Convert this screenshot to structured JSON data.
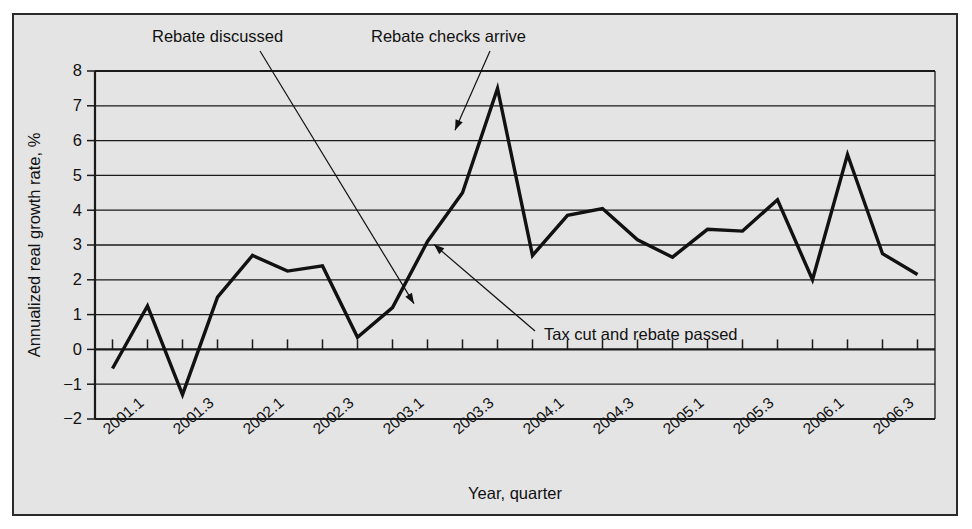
{
  "figure": {
    "top_cut_text": "",
    "background_color": "#e4e4e4",
    "frame_color": "#2a2a2a",
    "line_color": "#111111"
  },
  "chart_data": {
    "type": "line",
    "title": "",
    "xlabel": "Year, quarter",
    "ylabel": "Annualized real growth rate, %",
    "ylim": [
      -2,
      8
    ],
    "ytick_step": 1,
    "grid": true,
    "legend": "none",
    "x": [
      "2001.1",
      "2001.2",
      "2001.3",
      "2001.4",
      "2002.1",
      "2002.2",
      "2002.3",
      "2002.4",
      "2003.1",
      "2003.2",
      "2003.3",
      "2003.4",
      "2004.1",
      "2004.2",
      "2004.3",
      "2004.4",
      "2005.1",
      "2005.2",
      "2005.3",
      "2005.4",
      "2006.1",
      "2006.2",
      "2006.3",
      "2006.4"
    ],
    "values": [
      -0.55,
      1.25,
      -1.3,
      1.5,
      2.7,
      2.25,
      2.4,
      0.35,
      1.2,
      3.1,
      4.5,
      7.5,
      2.7,
      3.85,
      4.05,
      3.15,
      2.65,
      3.45,
      3.4,
      4.3,
      2.0,
      5.6,
      2.75,
      2.15
    ],
    "xtick_labels": [
      "2001.1",
      "2001.3",
      "2002.1",
      "2002.3",
      "2003.1",
      "2003.3",
      "2004.1",
      "2004.3",
      "2005.1",
      "2005.3",
      "2006.1",
      "2006.3"
    ],
    "ytick_labels": [
      "8",
      "7",
      "6",
      "5",
      "4",
      "3",
      "2",
      "1",
      "0",
      "−1",
      "−2"
    ],
    "annotations": [
      {
        "id": "rebate-discussed",
        "text": "Rebate discussed",
        "target_x": "2003.1",
        "target_y": 1.2
      },
      {
        "id": "rebate-checks-arrive",
        "text": "Rebate checks arrive",
        "target_x": "2003.3",
        "target_y": 6.3
      },
      {
        "id": "tax-cut-and-rebate-passed",
        "text": "Tax cut and rebate passed",
        "target_x": "2003.2",
        "target_y": 3.1
      }
    ]
  }
}
